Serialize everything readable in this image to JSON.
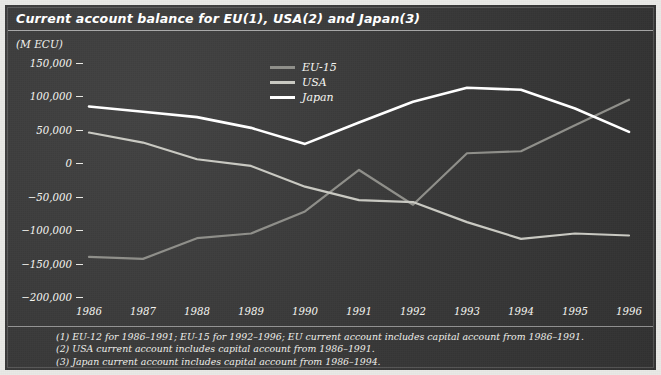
{
  "chart_data": {
    "type": "line",
    "title": "Current account balance for EU(1), USA(2) and Japan(3)",
    "unit_label": "(M ECU)",
    "xlabel": "",
    "ylabel": "(M ECU)",
    "grid": false,
    "legend_position": "top-center",
    "categories": [
      "1986",
      "1987",
      "1988",
      "1989",
      "1990",
      "1991",
      "1992",
      "1993",
      "1994",
      "1995",
      "1996"
    ],
    "x": [
      1986,
      1987,
      1988,
      1989,
      1990,
      1991,
      1992,
      1993,
      1994,
      1995,
      1996
    ],
    "ylim": [
      -200000,
      150000
    ],
    "yticks": [
      150000,
      100000,
      50000,
      0,
      -50000,
      -100000,
      -150000,
      -200000
    ],
    "ytick_labels": [
      "150,000",
      "100,000",
      "50,000",
      "0",
      "-50,000",
      "-100,000",
      "-150,000",
      "-200,000"
    ],
    "series": [
      {
        "name": "EU-15",
        "color": "#8f8f8a",
        "values": [
          -140000,
          -143000,
          -112000,
          -105000,
          -72000,
          -10000,
          -62000,
          15000,
          18000,
          57000,
          95000
        ]
      },
      {
        "name": "USA",
        "color": "#c9c9c2",
        "values": [
          46000,
          31000,
          6000,
          -4000,
          -35000,
          -55000,
          -58000,
          -88000,
          -113000,
          -105000,
          -108000
        ]
      },
      {
        "name": "Japan",
        "color": "#ffffff",
        "values": [
          85000,
          77000,
          69000,
          53000,
          29000,
          61000,
          92000,
          113000,
          110000,
          82000,
          47000
        ]
      }
    ],
    "footnotes": [
      "(1) EU-12 for 1986–1991; EU-15 for 1992–1996; EU current account includes capital account from 1986–1991.",
      "(2) USA current account includes capital account from 1986–1991.",
      "(3) Japan current account includes capital account from 1986–1994."
    ]
  },
  "colors": {
    "background": "#3a3a3a",
    "frame": "#e9e9e6",
    "text": "#f4f4f0",
    "series_eu": "#8f8f8a",
    "series_usa": "#c9c9c2",
    "series_japan": "#ffffff"
  }
}
